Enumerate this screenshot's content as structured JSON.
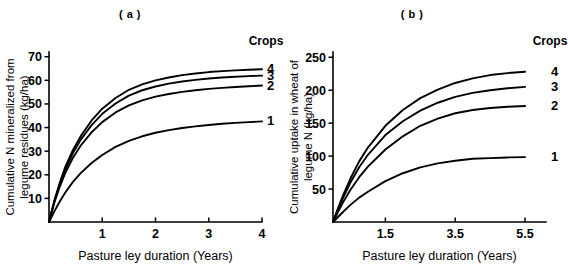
{
  "figure": {
    "background": "#ffffff",
    "ink_color": "#000000"
  },
  "panels": [
    {
      "id": "a",
      "title": "( a )",
      "legend_title": "Crops",
      "xlabel": "Pasture ley duration (Years)",
      "ylabel_line1": "Cumulative N mineralized from",
      "ylabel_line2": "legume residues (kg/ha)"
    },
    {
      "id": "b",
      "title": "( b )",
      "legend_title": "Crops",
      "xlabel": "Pasture ley duration (Years)",
      "ylabel_line1": "Cumulative uptake in wheat of",
      "ylabel_line2": "legume N (kg/ha)"
    }
  ],
  "chart_data": [
    {
      "type": "line",
      "panel": "a",
      "title": "( a )",
      "xlabel": "Pasture ley duration (Years)",
      "ylabel": "Cumulative N mineralized from legume residues (kg/ha)",
      "xlim": [
        0,
        4
      ],
      "ylim": [
        0,
        72
      ],
      "xticks": [
        1,
        2,
        3,
        4
      ],
      "xtick_labels": [
        "1",
        "2",
        "3",
        "4"
      ],
      "yticks": [
        10,
        20,
        30,
        40,
        50,
        60,
        70
      ],
      "ytick_labels": [
        "10",
        "20",
        "30",
        "40",
        "50",
        "60",
        "70"
      ],
      "grid": false,
      "legend_title": "Crops",
      "legend_position": "right-of-curve-ends",
      "series": [
        {
          "name": "4",
          "label": "4",
          "x": [
            0,
            0.1,
            0.2,
            0.3,
            0.45,
            0.6,
            0.8,
            1.0,
            1.25,
            1.5,
            1.75,
            2.0,
            2.25,
            2.5,
            2.75,
            3.0,
            3.25,
            3.5,
            3.75,
            4.0
          ],
          "y": [
            0,
            9.0,
            16.5,
            23.0,
            30.5,
            36.5,
            43.0,
            48.0,
            52.5,
            56.0,
            58.3,
            60.0,
            61.2,
            62.2,
            62.9,
            63.5,
            63.9,
            64.2,
            64.5,
            64.7
          ]
        },
        {
          "name": "3",
          "label": "3",
          "x": [
            0,
            0.1,
            0.2,
            0.3,
            0.45,
            0.6,
            0.8,
            1.0,
            1.25,
            1.5,
            1.75,
            2.0,
            2.25,
            2.5,
            2.75,
            3.0,
            3.25,
            3.5,
            3.75,
            4.0
          ],
          "y": [
            0,
            8.7,
            15.8,
            22.0,
            29.2,
            35.0,
            41.0,
            45.8,
            50.2,
            53.5,
            55.8,
            57.4,
            58.6,
            59.5,
            60.2,
            60.8,
            61.2,
            61.5,
            61.8,
            62.0
          ]
        },
        {
          "name": "2",
          "label": "2",
          "x": [
            0,
            0.1,
            0.2,
            0.3,
            0.45,
            0.6,
            0.8,
            1.0,
            1.25,
            1.5,
            1.75,
            2.0,
            2.25,
            2.5,
            2.75,
            3.0,
            3.25,
            3.5,
            3.75,
            4.0
          ],
          "y": [
            0,
            8.2,
            14.8,
            20.5,
            27.2,
            32.5,
            38.0,
            42.3,
            46.4,
            49.4,
            51.5,
            53.1,
            54.2,
            55.1,
            55.8,
            56.4,
            56.8,
            57.2,
            57.5,
            57.8
          ]
        },
        {
          "name": "1",
          "label": "1",
          "x": [
            0,
            0.1,
            0.2,
            0.3,
            0.45,
            0.6,
            0.8,
            1.0,
            1.25,
            1.5,
            1.75,
            2.0,
            2.25,
            2.5,
            2.75,
            3.0,
            3.25,
            3.5,
            3.75,
            4.0
          ],
          "y": [
            0,
            4.5,
            8.6,
            12.3,
            17.0,
            20.8,
            25.0,
            28.4,
            31.8,
            34.4,
            36.3,
            37.8,
            38.9,
            39.8,
            40.5,
            41.1,
            41.6,
            42.0,
            42.3,
            42.6
          ]
        }
      ]
    },
    {
      "type": "line",
      "panel": "b",
      "title": "( b )",
      "xlabel": "Pasture ley duration (Years)",
      "ylabel": "Cumulative uptake in wheat of legume N (kg/ha)",
      "xlim": [
        0,
        6.1
      ],
      "ylim": [
        0,
        258
      ],
      "xticks": [
        1.5,
        3.5,
        5.5
      ],
      "xtick_labels": [
        "1.5",
        "3.5",
        "5.5"
      ],
      "yticks": [
        50,
        100,
        150,
        200,
        250
      ],
      "ytick_labels": [
        "50",
        "100",
        "150",
        "200",
        "250"
      ],
      "grid": false,
      "legend_title": "Crops",
      "legend_position": "right-of-curve-ends",
      "series": [
        {
          "name": "4",
          "label": "4",
          "x": [
            0,
            0.15,
            0.3,
            0.5,
            0.75,
            1.0,
            1.5,
            2.0,
            2.5,
            3.0,
            3.5,
            4.0,
            4.5,
            5.0,
            5.5
          ],
          "y": [
            0,
            22,
            42,
            66,
            92,
            113,
            146,
            170,
            188,
            201,
            211,
            218,
            223,
            226,
            228
          ]
        },
        {
          "name": "3",
          "label": "3",
          "x": [
            0,
            0.15,
            0.3,
            0.5,
            0.75,
            1.0,
            1.5,
            2.0,
            2.5,
            3.0,
            3.5,
            4.0,
            4.5,
            5.0,
            5.5
          ],
          "y": [
            0,
            20,
            38,
            60,
            83,
            102,
            132,
            153,
            169,
            181,
            190,
            196,
            200,
            203,
            205
          ]
        },
        {
          "name": "2",
          "label": "2",
          "x": [
            0,
            0.15,
            0.3,
            0.5,
            0.75,
            1.0,
            1.5,
            2.0,
            2.5,
            3.0,
            3.5,
            4.0,
            4.5,
            5.0,
            5.5
          ],
          "y": [
            0,
            16,
            31,
            49,
            68,
            84,
            110,
            130,
            146,
            157,
            165,
            170,
            173,
            175,
            176
          ]
        },
        {
          "name": "1",
          "label": "1",
          "x": [
            0,
            0.15,
            0.3,
            0.5,
            0.75,
            1.0,
            1.5,
            2.0,
            2.5,
            3.0,
            3.5,
            4.0,
            4.5,
            5.0,
            5.5
          ],
          "y": [
            0,
            8,
            16,
            26,
            37,
            46,
            62,
            74,
            83,
            89,
            93,
            96,
            97,
            98,
            98.5
          ]
        }
      ]
    }
  ]
}
